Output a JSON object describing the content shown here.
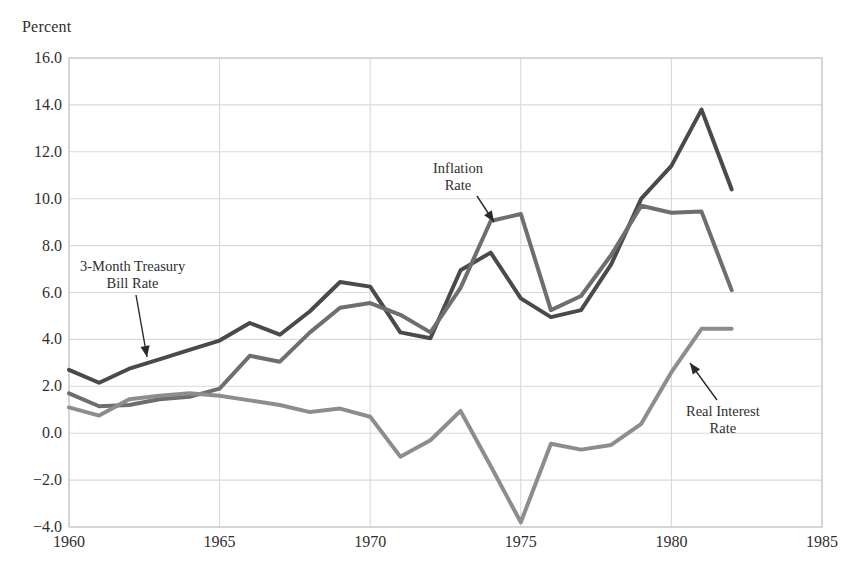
{
  "chart_data": {
    "type": "line",
    "title": "",
    "subtitle": "",
    "xlabel": "",
    "ylabel": "Percent",
    "ylabel_position": "top-left",
    "xlim": [
      1960,
      1985
    ],
    "ylim": [
      -4.0,
      16.0
    ],
    "grid": true,
    "legend_position": "inline-annotations",
    "x": [
      1960,
      1961,
      1962,
      1963,
      1964,
      1965,
      1966,
      1967,
      1968,
      1969,
      1970,
      1971,
      1972,
      1973,
      1974,
      1975,
      1976,
      1977,
      1978,
      1979,
      1980,
      1981,
      1982
    ],
    "xticks": [
      1960,
      1965,
      1970,
      1975,
      1980,
      1985
    ],
    "xtick_labels": [
      "1960",
      "1965",
      "1970",
      "1975",
      "1980",
      "1985"
    ],
    "yticks": [
      -4.0,
      -2.0,
      0.0,
      2.0,
      4.0,
      6.0,
      8.0,
      10.0,
      12.0,
      14.0,
      16.0
    ],
    "ytick_labels": [
      "−4.0",
      "−2.0",
      "0.0",
      "2.0",
      "4.0",
      "6.0",
      "8.0",
      "10.0",
      "12.0",
      "14.0",
      "16.0"
    ],
    "series": [
      {
        "name": "3-Month Treasury Bill Rate",
        "color": "#4a4a4a",
        "width": 4.0,
        "values": [
          2.7,
          2.15,
          2.75,
          3.15,
          3.55,
          3.95,
          4.7,
          4.2,
          5.2,
          6.45,
          6.25,
          4.3,
          4.05,
          6.95,
          7.7,
          5.75,
          4.95,
          5.25,
          7.2,
          10.0,
          11.4,
          13.8,
          10.4
        ]
      },
      {
        "name": "Inflation Rate",
        "color": "#6e6e6e",
        "width": 4.0,
        "values": [
          1.7,
          1.15,
          1.2,
          1.45,
          1.55,
          1.9,
          3.3,
          3.05,
          4.3,
          5.35,
          5.55,
          5.05,
          4.3,
          6.2,
          9.05,
          9.35,
          5.25,
          5.85,
          7.6,
          9.7,
          9.4,
          9.45,
          6.1
        ]
      },
      {
        "name": "Real Interest Rate",
        "color": "#8d8d8d",
        "width": 4.0,
        "values": [
          1.1,
          0.75,
          1.45,
          1.6,
          1.7,
          1.6,
          1.4,
          1.2,
          0.9,
          1.05,
          0.7,
          -1.0,
          -0.3,
          0.95,
          -1.4,
          -3.8,
          -0.45,
          -0.7,
          -0.5,
          0.4,
          2.6,
          4.45,
          4.45
        ]
      }
    ],
    "annotations": [
      {
        "name": "tbill-annotation",
        "text_line1": "3-Month Treasury",
        "text_line2": "Bill Rate",
        "text_x": 80,
        "text_y": 258,
        "arrow_from_x": 136,
        "arrow_from_y": 295,
        "arrow_to_x": 147,
        "arrow_to_y": 357
      },
      {
        "name": "inflation-annotation",
        "text_line1": "Inflation",
        "text_line2": "Rate",
        "text_x": 433,
        "text_y": 160,
        "arrow_from_x": 477,
        "arrow_from_y": 196,
        "arrow_to_x": 494,
        "arrow_to_y": 222
      },
      {
        "name": "real-rate-annotation",
        "text_line1": "Real Interest",
        "text_line2": "Rate",
        "text_x": 686,
        "text_y": 403,
        "arrow_from_x": 717,
        "arrow_from_y": 400,
        "arrow_to_x": 690,
        "arrow_to_y": 363
      }
    ],
    "axis": {
      "plot_left": 69,
      "plot_right": 822,
      "plot_top": 58,
      "plot_bottom": 527,
      "grid_color": "#d9d9d9",
      "frame_color": "#c9c9c9",
      "background": "#ffffff"
    }
  }
}
